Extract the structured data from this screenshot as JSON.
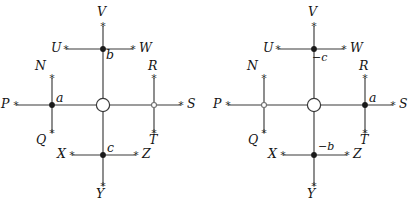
{
  "figure": {
    "type": "diagram-pair",
    "background_color": "#ffffff",
    "line_color": "#3a3a3a",
    "text_color": "#141414",
    "node_filled_color": "#1a1a1a",
    "node_open_color": "#6f6f6f",
    "terminal_marker": "asterisk-marker",
    "center_marker": "open-circle-marker"
  },
  "diagrams": [
    {
      "id": "left-diagram",
      "name": "diagram-left",
      "center": {
        "name": "center-junction",
        "marker": "open-circle"
      },
      "terminals": [
        {
          "id": "V",
          "label": "V",
          "position": "top-vertical-top"
        },
        {
          "id": "U",
          "label": "U",
          "position": "upper-branch-left"
        },
        {
          "id": "W",
          "label": "W",
          "position": "upper-branch-right"
        },
        {
          "id": "N",
          "label": "N",
          "position": "left-branch-top"
        },
        {
          "id": "P",
          "label": "P",
          "position": "horizontal-left"
        },
        {
          "id": "Q",
          "label": "Q",
          "position": "left-branch-bottom"
        },
        {
          "id": "R",
          "label": "R",
          "position": "right-branch-top"
        },
        {
          "id": "S",
          "label": "S",
          "position": "horizontal-right"
        },
        {
          "id": "T",
          "label": "T",
          "position": "right-branch-bottom"
        },
        {
          "id": "X",
          "label": "X",
          "position": "lower-branch-left"
        },
        {
          "id": "Z",
          "label": "Z",
          "position": "lower-branch-right"
        },
        {
          "id": "Y",
          "label": "Y",
          "position": "bottom-vertical-bottom"
        }
      ],
      "nodes": [
        {
          "id": "node-b",
          "label": "b",
          "marker": "filled",
          "position": "upper-branch-junction"
        },
        {
          "id": "node-a",
          "label": "a",
          "marker": "filled",
          "position": "left-branch-junction"
        },
        {
          "id": "node-right",
          "label": "",
          "marker": "open",
          "position": "right-branch-junction"
        },
        {
          "id": "node-c",
          "label": "c",
          "marker": "filled",
          "position": "lower-branch-junction"
        }
      ]
    },
    {
      "id": "right-diagram",
      "name": "diagram-right",
      "center": {
        "name": "center-junction",
        "marker": "open-circle"
      },
      "terminals": [
        {
          "id": "V",
          "label": "V",
          "position": "top-vertical-top"
        },
        {
          "id": "U",
          "label": "U",
          "position": "upper-branch-left"
        },
        {
          "id": "W",
          "label": "W",
          "position": "upper-branch-right"
        },
        {
          "id": "N",
          "label": "N",
          "position": "left-branch-top"
        },
        {
          "id": "P",
          "label": "P",
          "position": "horizontal-left"
        },
        {
          "id": "Q",
          "label": "Q",
          "position": "left-branch-bottom"
        },
        {
          "id": "R",
          "label": "R",
          "position": "right-branch-top"
        },
        {
          "id": "S",
          "label": "S",
          "position": "horizontal-right"
        },
        {
          "id": "T",
          "label": "T",
          "position": "right-branch-bottom"
        },
        {
          "id": "X",
          "label": "X",
          "position": "lower-branch-left"
        },
        {
          "id": "Z",
          "label": "Z",
          "position": "lower-branch-right"
        },
        {
          "id": "Y",
          "label": "Y",
          "position": "bottom-vertical-bottom"
        }
      ],
      "nodes": [
        {
          "id": "node-minus-c",
          "label": "−c",
          "marker": "filled",
          "position": "upper-branch-junction"
        },
        {
          "id": "node-left",
          "label": "",
          "marker": "open",
          "position": "left-branch-junction"
        },
        {
          "id": "node-a",
          "label": "a",
          "marker": "filled",
          "position": "right-branch-junction"
        },
        {
          "id": "node-minus-b",
          "label": "−b",
          "marker": "filled",
          "position": "lower-branch-junction"
        }
      ]
    }
  ]
}
